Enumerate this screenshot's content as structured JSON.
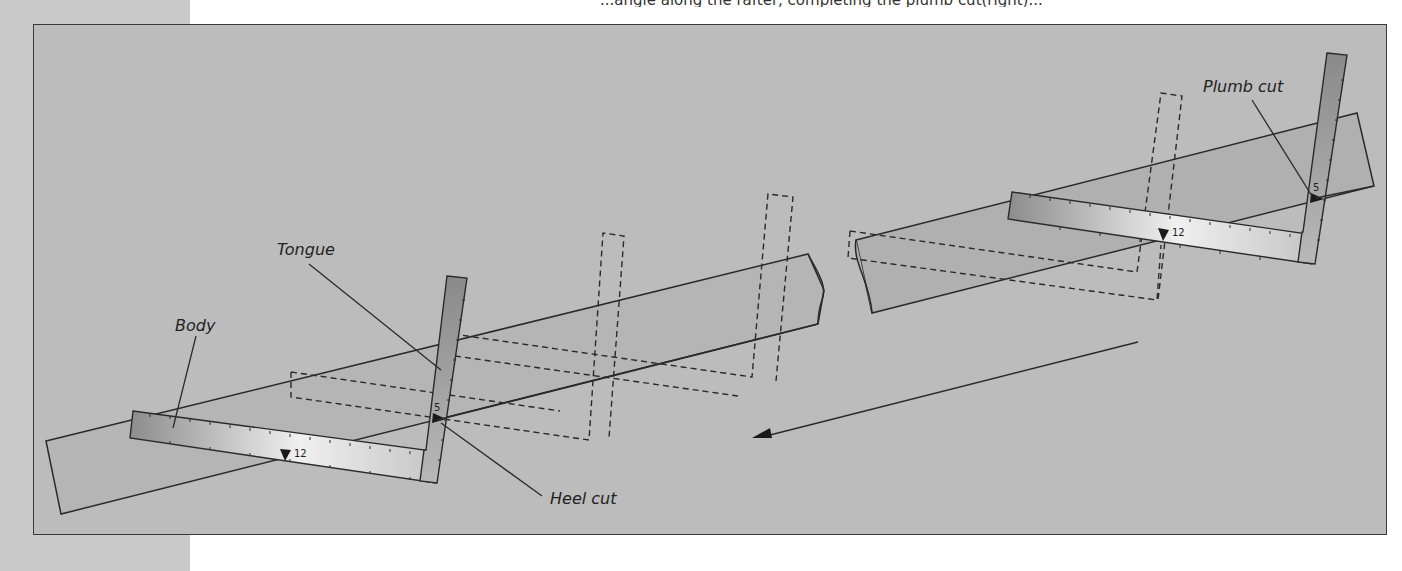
{
  "page": {
    "top_text_fragment": "...angle along the rafter, completing the plumb cut(right)..."
  },
  "figure": {
    "labels": {
      "body": "Body",
      "tongue": "Tongue",
      "heel_cut": "Heel cut",
      "plumb_cut": "Plumb cut"
    },
    "square_marks": {
      "body_mark": "12",
      "tongue_mark": "5"
    },
    "direction_arrow": "stepping direction toward heel (down-left)",
    "colors": {
      "panel_bg": "#bcbcbc",
      "rafter_fill": "#b2b2b2",
      "square_dark": "#8e8e8e",
      "square_light": "#ececec",
      "line": "#2a2a2a",
      "page_strip": "#c9c9c9"
    }
  }
}
